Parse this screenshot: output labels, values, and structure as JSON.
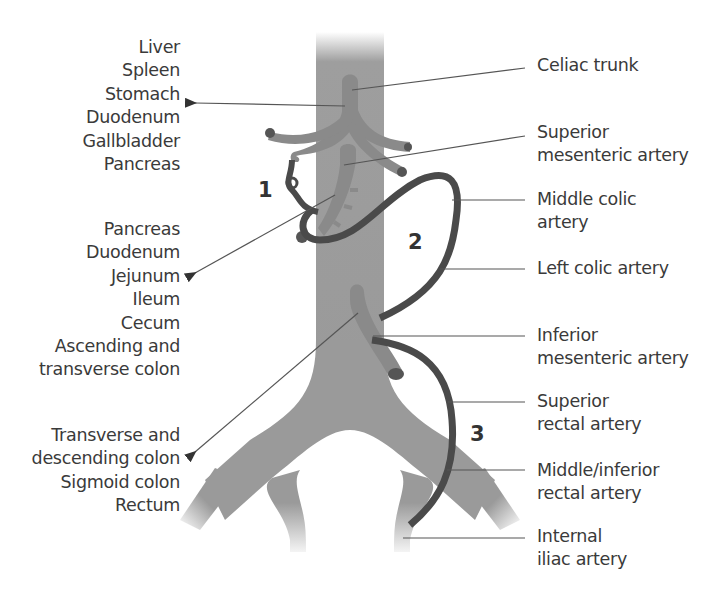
{
  "diagram": {
    "left_groups": [
      {
        "id": "celiac-organs",
        "lines": [
          "Liver",
          "Spleen",
          "Stomach",
          "Duodenum",
          "Gallbladder",
          "Pancreas"
        ]
      },
      {
        "id": "sma-organs",
        "lines": [
          "Pancreas",
          "Duodenum",
          "Jejunum",
          "Ileum",
          "Cecum",
          "Ascending and",
          "transverse colon"
        ]
      },
      {
        "id": "ima-organs",
        "lines": [
          "Transverse and",
          "descending colon",
          "Sigmoid colon",
          "Rectum"
        ]
      }
    ],
    "right_labels": [
      {
        "id": "celiac-trunk",
        "lines": [
          "Celiac trunk"
        ]
      },
      {
        "id": "superior-mesenteric-artery",
        "lines": [
          "Superior",
          "mesenteric artery"
        ]
      },
      {
        "id": "middle-colic-artery",
        "lines": [
          "Middle colic",
          "artery"
        ]
      },
      {
        "id": "left-colic-artery",
        "lines": [
          "Left colic artery"
        ]
      },
      {
        "id": "inferior-mesenteric-artery",
        "lines": [
          "Inferior",
          "mesenteric artery"
        ]
      },
      {
        "id": "superior-rectal-artery",
        "lines": [
          "Superior",
          "rectal artery"
        ]
      },
      {
        "id": "middle-inferior-rectal-artery",
        "lines": [
          "Middle/inferior",
          "rectal artery"
        ]
      },
      {
        "id": "internal-iliac-artery",
        "lines": [
          "Internal",
          "iliac artery"
        ]
      }
    ],
    "anastomosis_numbers": [
      "1",
      "2",
      "3"
    ],
    "colors": {
      "aorta": "#999999",
      "branch": "#8a8a8a",
      "anastomosis": "#4a4a4a",
      "leader_line": "#555555",
      "text": "#3a3a3a"
    }
  }
}
